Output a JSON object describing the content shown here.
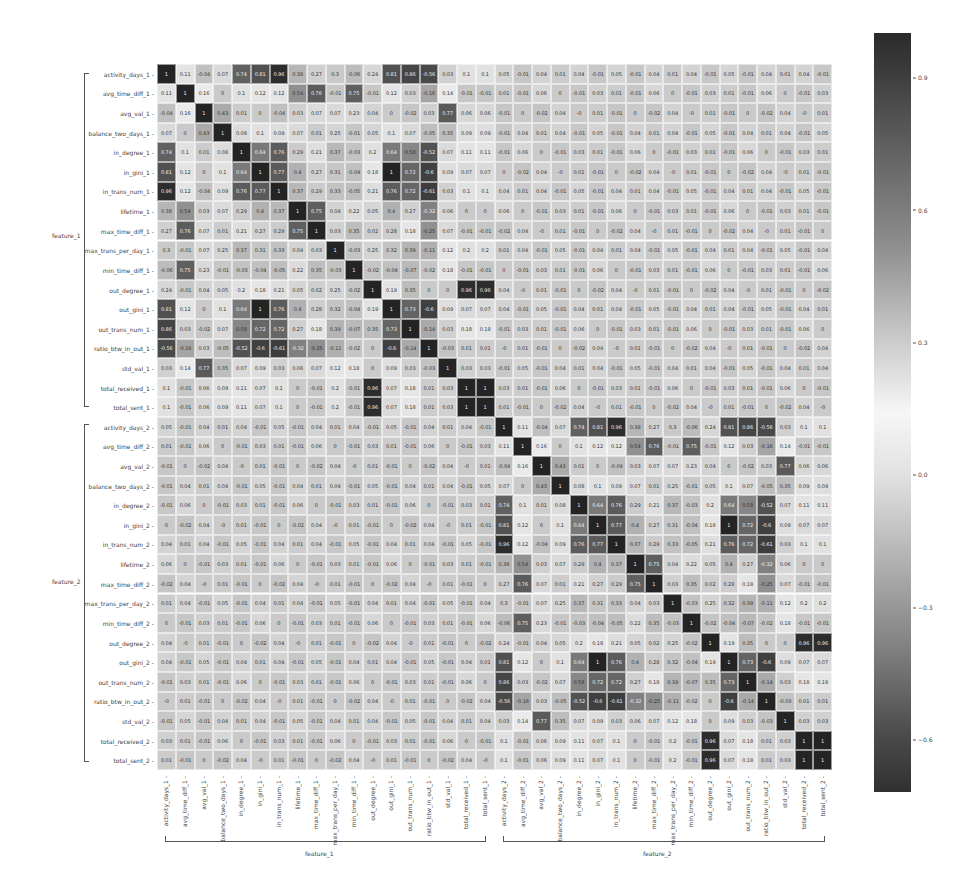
{
  "chart_data": {
    "type": "heatmap",
    "title": "",
    "xlabel_groups": [
      "feature_1",
      "feature_2"
    ],
    "ylabel_groups": [
      "feature_1",
      "feature_2"
    ],
    "base_features": [
      "activity_days",
      "avg_time_diff",
      "avg_val",
      "balance_two_days",
      "in_degree",
      "in_gini",
      "in_trans_num",
      "lifetime",
      "max_time_diff",
      "max_trans_per_day",
      "min_time_diff",
      "out_degree",
      "out_gini",
      "out_trans_num",
      "ratio_btw_in_out",
      "std_val",
      "total_received",
      "total_sent"
    ],
    "labels": [
      "activity_days_1",
      "avg_time_diff_1",
      "avg_val_1",
      "balance_two_days_1",
      "in_degree_1",
      "in_gini_1",
      "in_trans_num_1",
      "lifetime_1",
      "max_time_diff_1",
      "max_trans_per_day_1",
      "min_time_diff_1",
      "out_degree_1",
      "out_gini_1",
      "out_trans_num_1",
      "ratio_btw_in_out_1",
      "std_val_1",
      "total_received_1",
      "total_sent_1",
      "activity_days_2",
      "avg_time_diff_2",
      "avg_val_2",
      "balance_two_days_2",
      "in_degree_2",
      "in_gini_2",
      "in_trans_num_2",
      "lifetime_2",
      "max_time_diff_2",
      "max_trans_per_day_2",
      "min_time_diff_2",
      "out_degree_2",
      "out_gini_2",
      "out_trans_num_2",
      "ratio_btw_in_out_2",
      "std_val_2",
      "total_received_2",
      "total_sent_2"
    ],
    "within_block": [
      [
        1,
        0.11,
        -0.04,
        0.07,
        0.74,
        0.81,
        0.96,
        0.38,
        0.27,
        0.3,
        -0.06,
        0.24,
        0.81,
        0.86,
        -0.56,
        0.03,
        0.1,
        0.1
      ],
      [
        0.11,
        1,
        0.16,
        0,
        0.1,
        0.12,
        0.12,
        0.54,
        0.76,
        -0.01,
        0.75,
        -0.01,
        0.12,
        0.03,
        -0.16,
        0.14,
        -0.01,
        -0.01
      ],
      [
        -0.04,
        0.16,
        1,
        0.43,
        0.01,
        0,
        -0.04,
        0.03,
        0.07,
        0.07,
        0.23,
        0.04,
        0,
        -0.02,
        0.03,
        0.77,
        0.06,
        0.06
      ],
      [
        0.07,
        0,
        0.43,
        1,
        0.08,
        0.1,
        0.09,
        0.07,
        0.01,
        0.25,
        -0.01,
        0.05,
        0.1,
        0.07,
        -0.05,
        0.35,
        0.09,
        0.09
      ],
      [
        0.74,
        0.1,
        0.01,
        0.08,
        1,
        0.64,
        0.76,
        0.29,
        0.21,
        0.37,
        -0.03,
        0.2,
        0.64,
        0.58,
        -0.52,
        0.07,
        0.11,
        0.11
      ],
      [
        0.81,
        0.12,
        0,
        0.1,
        0.64,
        1,
        0.77,
        0.4,
        0.27,
        0.31,
        -0.04,
        0.18,
        1,
        0.72,
        -0.6,
        0.09,
        0.07,
        0.07
      ],
      [
        0.96,
        0.12,
        -0.04,
        0.09,
        0.76,
        0.77,
        1,
        0.37,
        0.29,
        0.33,
        -0.05,
        0.21,
        0.76,
        0.72,
        -0.61,
        0.03,
        0.1,
        0.1
      ],
      [
        0.38,
        0.54,
        0.03,
        0.07,
        0.29,
        0.4,
        0.37,
        1,
        0.75,
        0.04,
        0.22,
        0.05,
        0.4,
        0.27,
        -0.32,
        0.06,
        0,
        0
      ],
      [
        0.27,
        0.76,
        0.07,
        0.01,
        0.21,
        0.27,
        0.29,
        0.75,
        1,
        0.03,
        0.35,
        0.02,
        0.28,
        0.18,
        -0.25,
        0.07,
        -0.01,
        -0.01
      ],
      [
        0.3,
        -0.01,
        0.07,
        0.25,
        0.37,
        0.31,
        0.33,
        0.04,
        0.03,
        1,
        -0.03,
        0.25,
        0.32,
        0.39,
        -0.11,
        0.12,
        0.2,
        0.2
      ],
      [
        -0.06,
        0.75,
        0.23,
        -0.01,
        -0.03,
        -0.04,
        -0.05,
        0.22,
        0.35,
        -0.03,
        1,
        -0.02,
        -0.04,
        -0.07,
        -0.02,
        0.18,
        -0.01,
        -0.01
      ],
      [
        0.24,
        -0.01,
        0.04,
        0.05,
        0.2,
        0.18,
        0.21,
        0.05,
        0.02,
        0.25,
        -0.02,
        1,
        0.19,
        0.35,
        0,
        0,
        0.96,
        0.96
      ],
      [
        0.81,
        0.12,
        0,
        0.1,
        0.64,
        1,
        0.76,
        0.4,
        0.28,
        0.32,
        -0.04,
        0.19,
        1,
        0.73,
        -0.6,
        0.09,
        0.07,
        0.07
      ],
      [
        0.86,
        0.03,
        -0.02,
        0.07,
        0.58,
        0.72,
        0.72,
        0.27,
        0.18,
        0.39,
        -0.07,
        0.35,
        0.73,
        1,
        -0.14,
        0.03,
        0.18,
        0.18
      ],
      [
        -0.56,
        -0.16,
        0.03,
        -0.05,
        -0.52,
        -0.6,
        -0.61,
        -0.32,
        -0.25,
        -0.11,
        -0.02,
        0,
        -0.6,
        -0.14,
        1,
        -0.03,
        0.01,
        0.01
      ],
      [
        0.03,
        0.14,
        0.77,
        0.35,
        0.07,
        0.09,
        0.03,
        0.06,
        0.07,
        0.12,
        0.18,
        0,
        0.09,
        0.03,
        -0.03,
        1,
        0.03,
        0.03
      ],
      [
        0.1,
        -0.01,
        0.06,
        0.09,
        0.11,
        0.07,
        0.1,
        0,
        -0.01,
        0.2,
        -0.01,
        0.96,
        0.07,
        0.18,
        0.01,
        0.03,
        1,
        1
      ],
      [
        0.1,
        -0.01,
        0.06,
        0.09,
        0.11,
        0.07,
        0.1,
        0,
        -0.01,
        0.2,
        -0.01,
        0.96,
        0.07,
        0.18,
        0.01,
        0.03,
        1,
        1
      ]
    ],
    "cross_block_sample_row_activity_days_2": [
      0.05,
      -0.01,
      -0.02,
      -0.01,
      0.03,
      0.04,
      0.04,
      0.01,
      0,
      0.01,
      -0.01,
      0.01,
      0.04,
      0.06,
      -0.01,
      -0.01,
      0,
      0
    ],
    "cross_block_note": "feature_1 x feature_2 correlations are all within about -0.02..0.06",
    "colorbar": {
      "ticks": [
        0.9,
        0.6,
        0.3,
        0.0,
        -0.3,
        -0.6
      ],
      "tick_labels": [
        "0.9",
        "0.6",
        "0.3",
        "0.0",
        "−0.3",
        "−0.6"
      ],
      "range": [
        -0.72,
        1.0
      ],
      "cmap": "grayscale diverging (dark at high |r|, light near 0.15)"
    },
    "annot": true,
    "grid": false,
    "legend_position": "right (colorbar)"
  },
  "axis": {
    "y_group_1": "feature_1",
    "y_group_2": "feature_2",
    "x_group_1": "feature_1",
    "x_group_2": "feature_2"
  }
}
